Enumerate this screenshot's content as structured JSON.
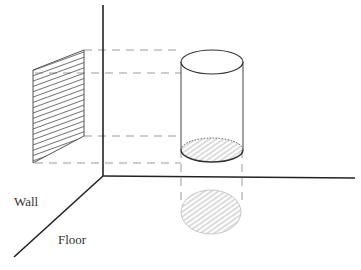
{
  "diagram": {
    "type": "orthographic-projection",
    "labels": {
      "wall": "Wall",
      "floor": "Floor"
    },
    "objects": [
      {
        "name": "cylinder",
        "description": "3D cylinder with hatched base"
      },
      {
        "name": "wall-projection",
        "description": "hatched parallelogram projected on wall plane"
      },
      {
        "name": "floor-projection",
        "description": "hatched ellipse projected on floor plane"
      }
    ],
    "colors": {
      "axis": "#222222",
      "outline": "#444444",
      "dashed": "#9a9a9a",
      "hatch": "#888888"
    }
  }
}
